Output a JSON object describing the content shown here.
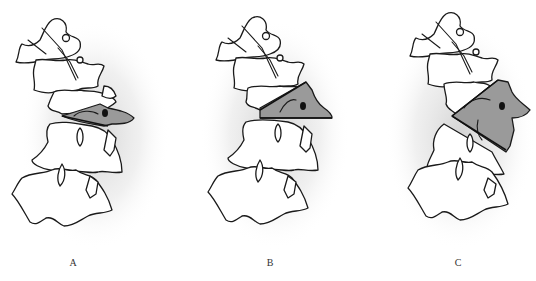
{
  "figure": {
    "type": "spinal vertebrae lateral illustration",
    "panels": [
      {
        "id": "A",
        "label": "A",
        "shaded_region": "thin horizontal wedge through one vertebral segment"
      },
      {
        "id": "B",
        "label": "B",
        "shaded_region": "triangular wedge with oblique upper cut"
      },
      {
        "id": "C",
        "label": "C",
        "shaded_region": "large triangular wedge with two oblique cuts"
      }
    ],
    "colors": {
      "outline": "#1a1a1a",
      "shaded": "#9a9a9a",
      "background": "#ffffff",
      "halo": "#d8d8d8"
    }
  }
}
